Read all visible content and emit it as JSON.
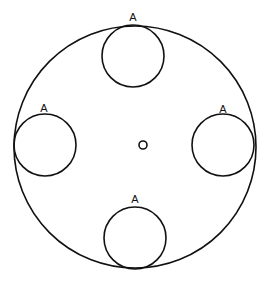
{
  "diagram": {
    "outer_circle": {
      "cx": 135,
      "cy": 147,
      "r": 121
    },
    "center_hole": {
      "cx": 143,
      "cy": 145,
      "r": 4
    },
    "inner_circles": [
      {
        "position": "top",
        "cx": 133,
        "cy": 56,
        "r": 31,
        "label": "A",
        "lx": 133,
        "ly": 21
      },
      {
        "position": "left",
        "cx": 45,
        "cy": 145,
        "r": 31,
        "label": "A",
        "lx": 44,
        "ly": 112
      },
      {
        "position": "right",
        "cx": 223,
        "cy": 145,
        "r": 31,
        "label": "A",
        "lx": 223,
        "ly": 113
      },
      {
        "position": "bottom",
        "cx": 135,
        "cy": 238,
        "r": 31,
        "label": "A",
        "lx": 135,
        "ly": 203
      }
    ],
    "stroke_color": "#111111",
    "background": "#ffffff"
  }
}
